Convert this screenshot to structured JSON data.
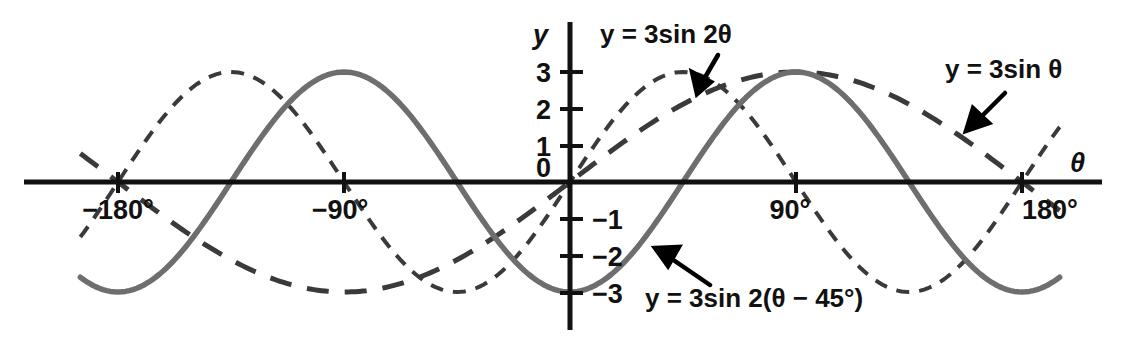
{
  "figure": {
    "title": "",
    "background_color": "#ffffff",
    "axis_color": "#111111",
    "solid_curve_color": "#6e6e6e",
    "dashed_curve_color": "#3a3a3a"
  },
  "axes": {
    "x_axis_label": "θ",
    "y_axis_label": "y",
    "x_ticks": [
      {
        "value": -180,
        "label": "−180°"
      },
      {
        "value": -90,
        "label": "−90°"
      },
      {
        "value": 90,
        "label": "90°"
      },
      {
        "value": 180,
        "label": "180°"
      }
    ],
    "y_ticks": [
      {
        "value": 3,
        "label": "3"
      },
      {
        "value": 2,
        "label": "2"
      },
      {
        "value": 1,
        "label": "1"
      },
      {
        "value": 0,
        "label": "0"
      },
      {
        "value": -1,
        "label": "−1"
      },
      {
        "value": -2,
        "label": "−2"
      },
      {
        "value": -3,
        "label": "−3"
      }
    ]
  },
  "annotations": [
    {
      "id": "label-3sin2theta",
      "text": "y = 3sin 2θ",
      "points_to": "short-dashed curve"
    },
    {
      "id": "label-3sintheta",
      "text": "y = 3sin θ",
      "points_to": "long-dashed curve"
    },
    {
      "id": "label-3sin2theta-minus45",
      "text": "y = 3sin 2(θ − 45°)",
      "points_to": "solid curve"
    }
  ],
  "chart_data": {
    "type": "line",
    "title": "",
    "xlabel": "θ",
    "ylabel": "y",
    "xlim": [
      -195,
      195
    ],
    "ylim": [
      -3.4,
      3.4
    ],
    "grid": false,
    "legend": "inline annotations with arrows",
    "x_tick_values": [
      -180,
      -90,
      0,
      90,
      180
    ],
    "x_tick_labels": [
      "−180°",
      "−90°",
      "0",
      "90°",
      "180°"
    ],
    "y_tick_values": [
      3,
      2,
      1,
      0,
      -1,
      -2,
      -3
    ],
    "y_tick_labels": [
      "3",
      "2",
      "1",
      "0",
      "−1",
      "−2",
      "−3"
    ],
    "series": [
      {
        "name": "y = 3sin θ",
        "style": "long-dashed",
        "color": "#3a3a3a",
        "amplitude": 3,
        "period_deg": 360,
        "phase_deg": 0,
        "formula": "y = 3*sin(theta)",
        "x": [
          -195,
          -180,
          -165,
          -150,
          -135,
          -120,
          -105,
          -90,
          -75,
          -60,
          -45,
          -30,
          -15,
          0,
          15,
          30,
          45,
          60,
          75,
          90,
          105,
          120,
          135,
          150,
          165,
          180,
          195
        ],
        "y": [
          0.78,
          0.0,
          -0.78,
          -1.5,
          -2.12,
          -2.6,
          -2.9,
          -3.0,
          -2.9,
          -2.6,
          -2.12,
          -1.5,
          -0.78,
          0.0,
          0.78,
          1.5,
          2.12,
          2.6,
          2.9,
          3.0,
          2.9,
          2.6,
          2.12,
          1.5,
          0.78,
          0.0,
          -0.78
        ]
      },
      {
        "name": "y = 3sin 2θ",
        "style": "short-dashed",
        "color": "#3a3a3a",
        "amplitude": 3,
        "period_deg": 180,
        "phase_deg": 0,
        "formula": "y = 3*sin(2*theta)",
        "x": [
          -195,
          -180,
          -165,
          -150,
          -135,
          -120,
          -105,
          -90,
          -75,
          -60,
          -45,
          -30,
          -15,
          0,
          15,
          30,
          45,
          60,
          75,
          90,
          105,
          120,
          135,
          150,
          165,
          180,
          195
        ],
        "y": [
          1.5,
          0.0,
          -1.5,
          -2.6,
          -3.0,
          -2.6,
          -1.5,
          0.0,
          1.5,
          2.6,
          3.0,
          2.6,
          1.5,
          0.0,
          1.5,
          2.6,
          3.0,
          2.6,
          1.5,
          0.0,
          -1.5,
          -2.6,
          -3.0,
          -2.6,
          -1.5,
          0.0,
          1.5
        ]
      },
      {
        "name": "y = 3sin 2(θ − 45°)",
        "style": "solid",
        "color": "#6e6e6e",
        "amplitude": 3,
        "period_deg": 180,
        "phase_deg": 45,
        "formula": "y = 3*sin(2*(theta - 45))",
        "x": [
          -195,
          -180,
          -165,
          -150,
          -135,
          -120,
          -105,
          -90,
          -75,
          -60,
          -45,
          -30,
          -15,
          0,
          15,
          30,
          45,
          60,
          75,
          90,
          105,
          120,
          135,
          150,
          165,
          180,
          195
        ],
        "y": [
          -2.6,
          -3.0,
          -2.6,
          -1.5,
          0.0,
          1.5,
          2.6,
          3.0,
          2.6,
          1.5,
          0.0,
          -1.5,
          -2.6,
          -3.0,
          -2.6,
          -1.5,
          0.0,
          1.5,
          2.6,
          3.0,
          2.6,
          1.5,
          0.0,
          -1.5,
          -2.6,
          -3.0,
          -2.6
        ]
      }
    ]
  }
}
